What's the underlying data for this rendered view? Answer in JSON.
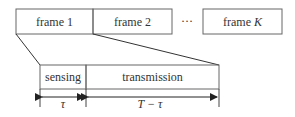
{
  "diagram": {
    "top_row": {
      "frames": [
        {
          "label": "frame 1"
        },
        {
          "label": "frame 2"
        },
        {
          "label": "frame ",
          "label_italic": "K"
        }
      ],
      "ellipsis": "···"
    },
    "expanded_frame": {
      "segments": [
        {
          "label": "sensing",
          "duration": "τ"
        },
        {
          "label": "transmission",
          "duration": "T − τ"
        }
      ]
    },
    "colors": {
      "stroke": "#555555",
      "text": "#333333",
      "background": "#ffffff"
    }
  }
}
